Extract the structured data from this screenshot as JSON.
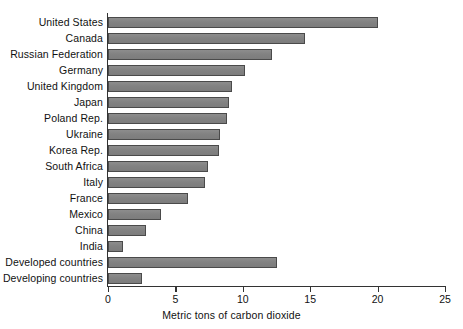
{
  "chart_data": {
    "type": "bar",
    "orientation": "horizontal",
    "title": "",
    "xlabel": "Metric tons of carbon dioxide",
    "ylabel": "",
    "xlim": [
      0,
      25
    ],
    "xticks": [
      0,
      5,
      10,
      15,
      20,
      25
    ],
    "xtick_labels": [
      "0",
      "5",
      "10",
      "15",
      "20",
      "25"
    ],
    "grid": false,
    "legend": false,
    "bar_color": "#878787",
    "bar_edge_color": "#4a4a4a",
    "axis_color": "#333333",
    "categories": [
      "United States",
      "Canada",
      "Russian Federation",
      "Germany",
      "United Kingdom",
      "Japan",
      "Poland Rep.",
      "Ukraine",
      "Korea Rep.",
      "South Africa",
      "Italy",
      "France",
      "Mexico",
      "China",
      "India",
      "Developed countries",
      "Developing countries"
    ],
    "values": [
      20.0,
      14.6,
      12.2,
      10.2,
      9.2,
      9.0,
      8.8,
      8.3,
      8.2,
      7.4,
      7.2,
      5.9,
      3.9,
      2.8,
      1.1,
      12.5,
      2.5
    ]
  }
}
